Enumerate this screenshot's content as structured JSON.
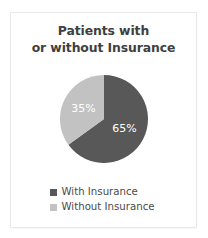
{
  "card": {
    "background": "#ffffff",
    "border_color": "#e9e9e9"
  },
  "title": {
    "line1": "Patients with",
    "line2": "or without Insurance",
    "color": "#3f3f3f"
  },
  "legend": {
    "items": [
      {
        "label": "With Insurance",
        "color": "#585858"
      },
      {
        "label": "Without Insurance",
        "color": "#c2c2c2"
      }
    ]
  },
  "chart_data": {
    "type": "pie",
    "title": "Patients with or without Insurance",
    "categories": [
      "With Insurance",
      "Without Insurance"
    ],
    "values": [
      65,
      35
    ],
    "unit": "%",
    "data_labels": [
      "65%",
      "35%"
    ],
    "colors": [
      "#585858",
      "#c2c2c2"
    ],
    "label_color": "#ffffff",
    "start_angle_deg": 0,
    "direction": "clockwise",
    "legend_position": "bottom",
    "grid": false,
    "xlabel": "",
    "ylabel": ""
  }
}
